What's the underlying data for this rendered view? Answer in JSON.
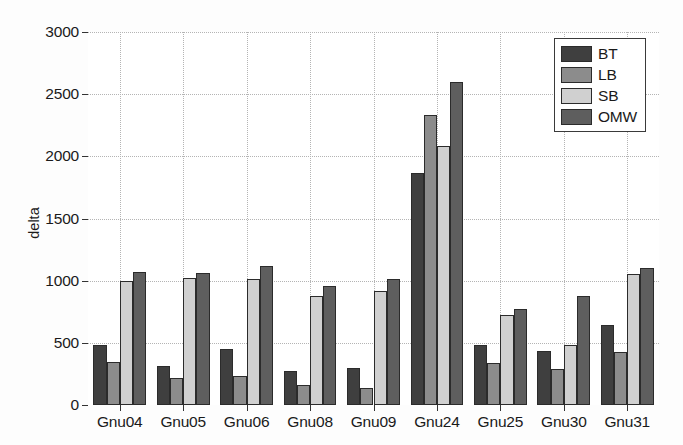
{
  "chart_data": {
    "type": "bar",
    "title": "",
    "subtitle": "",
    "xlabel": "",
    "ylabel": "delta",
    "orientation": "vertical",
    "grouping": "grouped",
    "grid": true,
    "grid_style": "dotted",
    "legend_position": "top-right",
    "background_color": "#ffffff",
    "axis_color": "#3a3a3a",
    "ylim": [
      0,
      3000
    ],
    "yticks": [
      0,
      500,
      1000,
      1500,
      2000,
      2500,
      3000
    ],
    "ytick_labels": [
      "0",
      "500",
      "1000",
      "1500",
      "2000",
      "2500",
      "3000"
    ],
    "categories": [
      "Gnu04",
      "Gnu05",
      "Gnu06",
      "Gnu08",
      "Gnu09",
      "Gnu24",
      "Gnu25",
      "Gnu30",
      "Gnu31"
    ],
    "series": [
      {
        "name": "BT",
        "color": "#3f3f3f",
        "values": [
          480,
          310,
          450,
          275,
          300,
          1865,
          480,
          435,
          645
        ]
      },
      {
        "name": "LB",
        "color": "#8c8c8c",
        "values": [
          345,
          215,
          235,
          160,
          140,
          2335,
          340,
          290,
          430
        ]
      },
      {
        "name": "SB",
        "color": "#d0d0d0",
        "values": [
          995,
          1025,
          1010,
          875,
          920,
          2085,
          725,
          480,
          1050
        ]
      },
      {
        "name": "OMW",
        "color": "#5e5e5e",
        "values": [
          1070,
          1060,
          1120,
          955,
          1015,
          2600,
          775,
          880,
          1100
        ]
      }
    ],
    "annotations": []
  },
  "legend": {
    "entries": [
      {
        "label": "BT"
      },
      {
        "label": "LB"
      },
      {
        "label": "SB"
      },
      {
        "label": "OMW"
      }
    ]
  }
}
